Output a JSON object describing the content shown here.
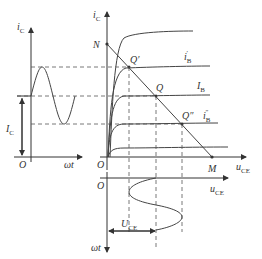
{
  "diagram": {
    "left_plot": {
      "y_axis_label": "i",
      "y_axis_sub": "C",
      "x_axis_label": "ωt",
      "origin_label": "O",
      "dc_label": "I",
      "dc_sub": "C"
    },
    "main_plot": {
      "y_axis_label": "i",
      "y_axis_sub": "C",
      "x_axis_label": "u",
      "x_axis_sub": "CE",
      "origin_label": "O",
      "point_N": "N",
      "point_M": "M",
      "q_prime": "Q′",
      "q": "Q",
      "q_dprime": "Q″",
      "curve_ib_prime": "i",
      "curve_ib_prime_sub": "B",
      "curve_ib_prime_mark": "′",
      "curve_IB": "I",
      "curve_IB_sub": "B",
      "curve_ib_dprime": "i",
      "curve_ib_dprime_sub": "B",
      "curve_ib_dprime_mark": "″"
    },
    "bottom_plot": {
      "origin_label": "O",
      "x_axis_label": "u",
      "x_axis_sub": "CE",
      "y_axis_label": "ωt",
      "dc_label": "U",
      "dc_sub": "CE"
    }
  }
}
